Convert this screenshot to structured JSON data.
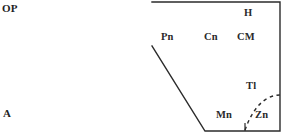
{
  "figure": {
    "type": "schematic-cross-section",
    "background_color": "#ffffff",
    "line_color": "#2b2b2b",
    "text_color": "#262626",
    "width": 284,
    "height": 137
  },
  "outer_labels": [
    {
      "key": "op",
      "text": "OP",
      "x": 2,
      "y": 3
    },
    {
      "key": "a",
      "text": "A",
      "x": 3,
      "y": 108
    }
  ],
  "inner_labels": [
    {
      "key": "pn",
      "text": "Pn",
      "x": 161,
      "y": 32
    },
    {
      "key": "cn",
      "text": "Cn",
      "x": 204,
      "y": 32
    },
    {
      "key": "cm",
      "text": "CM",
      "x": 237,
      "y": 32
    },
    {
      "key": "h",
      "text": "H",
      "x": 244,
      "y": 8
    },
    {
      "key": "tl",
      "text": "Tl",
      "x": 246,
      "y": 81
    },
    {
      "key": "mn",
      "text": "Mn",
      "x": 216,
      "y": 110
    },
    {
      "key": "zn",
      "text": "Zn",
      "x": 255,
      "y": 110
    }
  ],
  "shapes": {
    "boundary": {
      "name": "region-outline",
      "points": "152,2 280,2 280,131 205,131 152,46",
      "stroke": "#2b2b2b",
      "stroke_width": 1.4,
      "fill": "none"
    },
    "dashed_arc": {
      "name": "zn-tl-dashed-boundary",
      "path": "M 245,130 C 250,116 257,104 268,98 C 273,95.5 277,95 280,95",
      "stroke": "#2b2b2b",
      "stroke_width": 1.4,
      "dash": "3.5,3.5",
      "fill": "none"
    },
    "tick": {
      "name": "bottom-tick-mark",
      "x1": 245,
      "y1": 131,
      "x2": 245,
      "y2": 123,
      "stroke": "#2b2b2b",
      "stroke_width": 1.2
    }
  }
}
